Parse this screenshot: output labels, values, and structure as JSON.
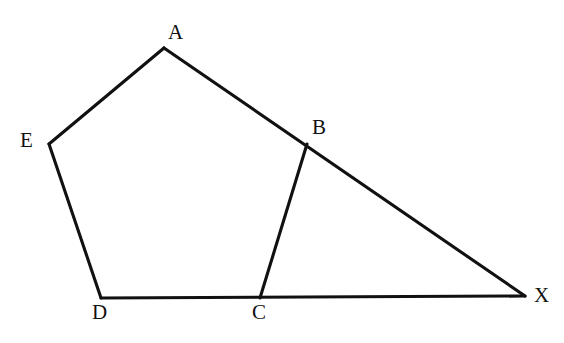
{
  "figure": {
    "type": "geometry-diagram",
    "background_color": "#ffffff",
    "stroke_color": "#111111",
    "stroke_width": 3.1,
    "canvas": {
      "width": 564,
      "height": 343
    },
    "vertices": [
      {
        "id": "A",
        "label": "A",
        "x": 164,
        "y": 48,
        "label_x": 168,
        "label_y": 22,
        "label_anchor": "above"
      },
      {
        "id": "B",
        "label": "B",
        "x": 307,
        "y": 144,
        "label_x": 312,
        "label_y": 117,
        "label_anchor": "above-right"
      },
      {
        "id": "C",
        "label": "C",
        "x": 260,
        "y": 298,
        "label_x": 252,
        "label_y": 303,
        "label_anchor": "below"
      },
      {
        "id": "D",
        "label": "D",
        "x": 101,
        "y": 298,
        "label_x": 92,
        "label_y": 303,
        "label_anchor": "below"
      },
      {
        "id": "E",
        "label": "E",
        "x": 49,
        "y": 144,
        "label_x": 20,
        "label_y": 130,
        "label_anchor": "left"
      },
      {
        "id": "X",
        "label": "X",
        "x": 525,
        "y": 296,
        "label_x": 535,
        "label_y": 285,
        "label_anchor": "right"
      }
    ],
    "edges": [
      {
        "id": "EA",
        "from": "E",
        "to": "A",
        "name": "edge-E-A"
      },
      {
        "id": "AB",
        "from": "A",
        "to": "B",
        "name": "edge-A-B"
      },
      {
        "id": "BX",
        "from": "B",
        "to": "X",
        "name": "edge-B-X"
      },
      {
        "id": "BC",
        "from": "B",
        "to": "C",
        "name": "edge-B-C"
      },
      {
        "id": "ED",
        "from": "E",
        "to": "D",
        "name": "edge-E-D"
      },
      {
        "id": "DC",
        "from": "D",
        "to": "C",
        "name": "edge-D-C"
      },
      {
        "id": "CX",
        "from": "C",
        "to": "X",
        "name": "edge-C-X"
      }
    ],
    "paths": {
      "pentagon_outline": "M 164 48 L 307 144 L 260 298 L 101 298 L 49 144 Z",
      "line_A_to_X": "M 164 48 L 525 296",
      "line_D_to_X": "M 101 298 L 525 296",
      "segment_B_to_C": "M 307 144 L 260 298"
    }
  },
  "labels": {
    "A": "A",
    "B": "B",
    "C": "C",
    "D": "D",
    "E": "E",
    "X": "X"
  }
}
